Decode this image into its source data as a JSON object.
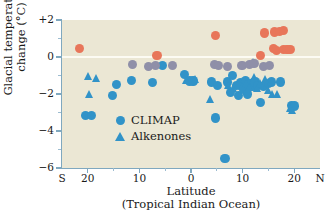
{
  "chart_data": {
    "type": "scatter",
    "title": "",
    "xlabel": "Latitude",
    "xlabel_sub": "(Tropical Indian Ocean)",
    "ylabel_line1": "Glacial temperature",
    "ylabel_line2": "change (°C)",
    "ylim": [
      -6,
      2
    ],
    "xlim": [
      -25,
      25
    ],
    "grid": false,
    "zero_line": true,
    "y_ticks": [
      "+2",
      "0",
      "−2",
      "−4",
      "−6"
    ],
    "y_tick_values": [
      2,
      0,
      -2,
      -4,
      -6
    ],
    "x_ticks": [
      "S",
      "20",
      "10",
      "0",
      "10",
      "20",
      "N"
    ],
    "x_tick_values": [
      -25,
      -20,
      -10,
      0,
      10,
      20,
      25
    ],
    "x_axis_note": "Negative values are southern latitudes, positive are northern",
    "legend": [
      {
        "label": "CLIMAP",
        "marker": "circle",
        "color": "#3193c8"
      },
      {
        "label": "Alkenones",
        "marker": "triangle",
        "color": "#3193c8"
      }
    ],
    "colors": {
      "climap_blue": "#3193c8",
      "alkenones_blue": "#3193c8",
      "warm_orange": "#e8765a",
      "overlap_gray": "#8f8fa8",
      "plot_background": "#ebe7d4",
      "axis": "#7fa8bf",
      "zero_line": "#fdfcf4"
    },
    "series": [
      {
        "name": "CLIMAP",
        "marker": "circle",
        "color": "#3193c8",
        "points": [
          [
            -20.4,
            -3.15
          ],
          [
            -19.3,
            -3.15
          ],
          [
            -15.2,
            -2.1
          ],
          [
            -14.4,
            -1.5
          ],
          [
            -11.6,
            -1.25
          ],
          [
            -7.4,
            -1.4
          ],
          [
            -5.6,
            -0.45
          ],
          [
            -1.2,
            -0.95
          ],
          [
            -0.3,
            -1.3
          ],
          [
            0.4,
            -1.3
          ],
          [
            3.9,
            -1.35
          ],
          [
            4.8,
            -3.3
          ],
          [
            5.2,
            -1.55
          ],
          [
            6.6,
            -5.5
          ],
          [
            7.1,
            -1.35
          ],
          [
            7.6,
            -1.9
          ],
          [
            8.0,
            -1.0
          ],
          [
            8.8,
            -1.55
          ],
          [
            9.2,
            -2.1
          ],
          [
            9.6,
            -1.4
          ],
          [
            10.1,
            -1.75
          ],
          [
            10.6,
            -1.3
          ],
          [
            11.0,
            -2.0
          ],
          [
            11.5,
            -1.45
          ],
          [
            12.0,
            -1.6
          ],
          [
            12.4,
            -1.35
          ],
          [
            13.0,
            -1.55
          ],
          [
            13.5,
            -2.45
          ],
          [
            14.1,
            -1.6
          ],
          [
            15.0,
            -1.45
          ],
          [
            15.6,
            -1.35
          ],
          [
            17.4,
            -1.35
          ],
          [
            19.4,
            -2.6
          ],
          [
            20.0,
            -2.65
          ]
        ]
      },
      {
        "name": "Alkenones",
        "marker": "triangle",
        "color": "#3193c8",
        "points": [
          [
            -19.8,
            -1.1
          ],
          [
            -18.2,
            -1.2
          ],
          [
            -19.6,
            -2.05
          ],
          [
            -0.9,
            -1.3
          ],
          [
            0.9,
            -1.25
          ],
          [
            3.9,
            -2.35
          ],
          [
            7.3,
            -1.6
          ],
          [
            8.2,
            -1.75
          ],
          [
            9.4,
            -1.5
          ],
          [
            10.0,
            -1.65
          ],
          [
            10.8,
            -1.5
          ],
          [
            11.4,
            -1.7
          ],
          [
            12.1,
            -0.35
          ],
          [
            12.3,
            -1.15
          ],
          [
            13.0,
            -1.75
          ],
          [
            13.6,
            -1.5
          ],
          [
            14.4,
            -1.25
          ],
          [
            15.0,
            -1.85
          ],
          [
            15.8,
            -2.05
          ],
          [
            16.8,
            -2.05
          ],
          [
            19.3,
            -2.85
          ],
          [
            19.8,
            -2.95
          ]
        ]
      },
      {
        "name": "Warm anomalies",
        "marker": "circle",
        "color": "#e8765a",
        "points": [
          [
            -21.6,
            0.45
          ],
          [
            -6.6,
            0.1
          ],
          [
            4.7,
            1.15
          ],
          [
            13.5,
            0.1
          ],
          [
            14.3,
            1.3
          ],
          [
            16.2,
            1.35
          ],
          [
            17.1,
            1.4
          ],
          [
            17.9,
            1.45
          ],
          [
            16.0,
            0.45
          ],
          [
            16.6,
            0.35
          ],
          [
            18.0,
            0.4
          ],
          [
            18.6,
            0.4
          ],
          [
            19.2,
            0.4
          ]
        ]
      },
      {
        "name": "Overlapping markers",
        "marker": "circle",
        "color": "#8f8fa8",
        "points": [
          [
            -11.4,
            -0.4
          ],
          [
            -8.2,
            -0.5
          ],
          [
            -6.9,
            -0.45
          ],
          [
            -3.6,
            -0.45
          ],
          [
            4.6,
            -0.4
          ],
          [
            5.4,
            -0.45
          ],
          [
            7.0,
            -0.5
          ],
          [
            9.9,
            -0.45
          ],
          [
            11.3,
            -0.4
          ],
          [
            12.2,
            -0.35
          ],
          [
            14.0,
            -0.5
          ],
          [
            15.2,
            -0.45
          ]
        ]
      }
    ]
  }
}
